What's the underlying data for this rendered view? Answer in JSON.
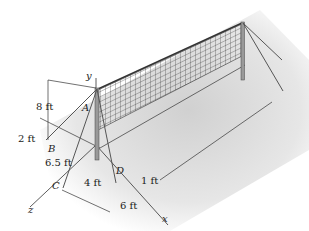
{
  "figure": {
    "type": "engineering-statics-diagram",
    "points": {
      "A": "A",
      "B": "B",
      "C": "C",
      "D": "D"
    },
    "axes": {
      "x": "x",
      "y": "y",
      "z": "z"
    },
    "dimensions": {
      "height_A": "8 ft",
      "B_offset": "2 ft",
      "B_to_C": "6.5 ft",
      "C_to_D": "4 ft",
      "D_offset": "1 ft",
      "x_span": "6 ft"
    }
  }
}
